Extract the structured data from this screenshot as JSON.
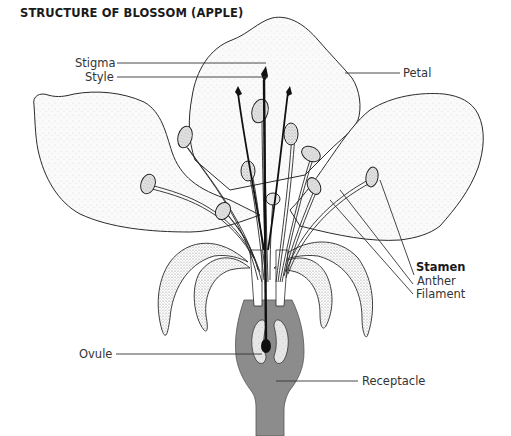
{
  "title": "STRUCTURE OF BLOSSOM (APPLE)",
  "labels": {
    "stigma": "Stigma",
    "style": "Style",
    "petal": "Petal",
    "stamen": "Stamen",
    "anther": "Anther",
    "filament": "Filament",
    "ovule": "Ovule",
    "receptacle": "Receptacle"
  },
  "colors": {
    "line": "#2a2a2a",
    "receptacle_fill": "#8c8c8c",
    "ovule_fill": "#e8e8e8",
    "style_dark": "#111111",
    "petal_fill": "#f7f7f7"
  }
}
